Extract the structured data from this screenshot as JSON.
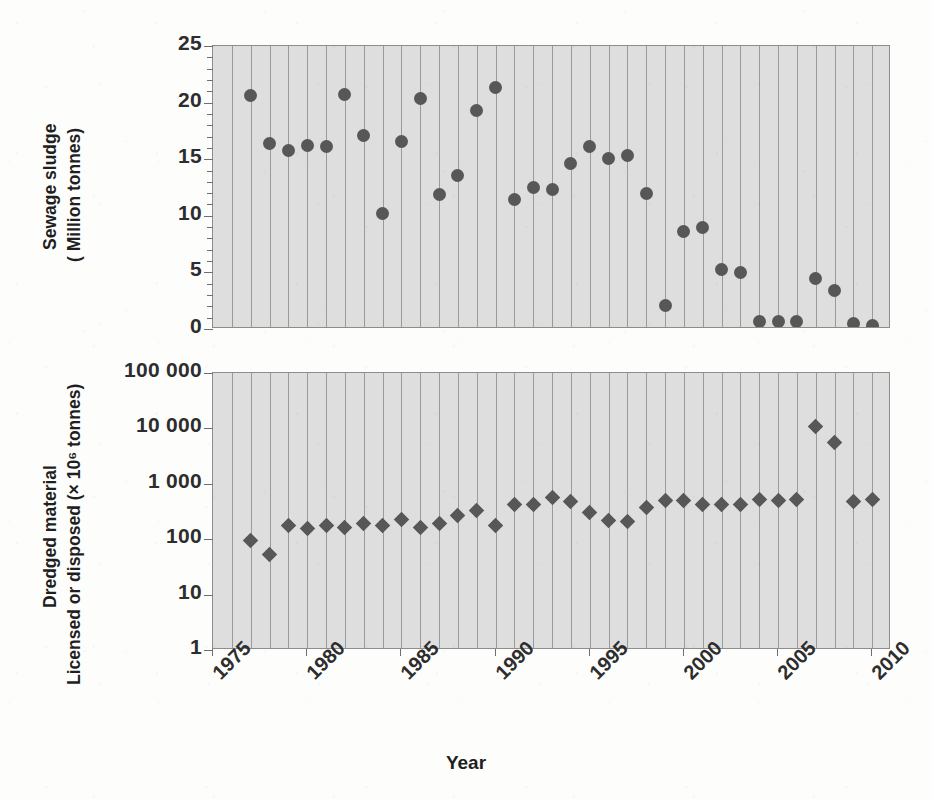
{
  "figure": {
    "x_axis_title": "Year",
    "background_color": "#dedede",
    "marker_color": "#575757",
    "gridline_color": "#9a9a9a",
    "axis_color": "#8d8d8d"
  },
  "panels": [
    {
      "id": "sewage-sludge",
      "y_title_line1": "Sewage sludge",
      "y_title_line2": "( Million tonnes)",
      "y_ticks": [
        "25",
        "20",
        "15",
        "10",
        "5",
        "0"
      ]
    },
    {
      "id": "dredged-material",
      "y_title_line1": "Dredged material",
      "y_title_line2": "Licensed or disposed (× 10⁶ tonnes)",
      "y_ticks": [
        "100 000",
        "10 000",
        "1 000",
        "100",
        "10",
        "1"
      ]
    }
  ],
  "x_ticks": [
    "1975",
    "1980",
    "1985",
    "1990",
    "1995",
    "2000",
    "2005",
    "2010"
  ],
  "chart_data": [
    {
      "type": "scatter",
      "title": "Sewage sludge",
      "xlabel": "Year",
      "ylabel": "Sewage sludge (Million tonnes)",
      "yscale": "linear",
      "ylim": [
        0,
        25
      ],
      "xlim": [
        1975,
        2011
      ],
      "ytick_values": [
        0,
        5,
        10,
        15,
        20,
        25
      ],
      "xtick_values": [
        1975,
        1980,
        1985,
        1990,
        1995,
        2000,
        2005,
        2010
      ],
      "grid": "vertical-only",
      "legend": "none",
      "marker": "circle",
      "x": [
        1977,
        1978,
        1979,
        1980,
        1981,
        1982,
        1983,
        1984,
        1985,
        1986,
        1987,
        1988,
        1989,
        1990,
        1991,
        1992,
        1993,
        1994,
        1995,
        1996,
        1997,
        1998,
        1999,
        2000,
        2001,
        2002,
        2003,
        2004,
        2005,
        2006,
        2007,
        2008,
        2009,
        2010
      ],
      "y": [
        20.6,
        16.4,
        15.8,
        16.2,
        16.1,
        20.7,
        17.1,
        10.2,
        16.6,
        20.4,
        11.9,
        13.6,
        19.3,
        21.3,
        11.4,
        12.5,
        12.3,
        14.6,
        16.1,
        15.1,
        15.3,
        12.0,
        2.1,
        8.6,
        9.0,
        5.3,
        5.0,
        0.7,
        0.7,
        0.7,
        4.5,
        3.4,
        0.5,
        0.3
      ]
    },
    {
      "type": "scatter",
      "title": "Dredged material",
      "xlabel": "Year",
      "ylabel": "Dredged material Licensed or disposed (× 10⁶ tonnes)",
      "yscale": "log",
      "ylim": [
        1,
        100000
      ],
      "xlim": [
        1975,
        2011
      ],
      "ytick_values": [
        1,
        10,
        100,
        1000,
        10000,
        100000
      ],
      "xtick_values": [
        1975,
        1980,
        1985,
        1990,
        1995,
        2000,
        2005,
        2010
      ],
      "grid": "vertical-only",
      "legend": "none",
      "marker": "diamond",
      "x": [
        1977,
        1978,
        1979,
        1980,
        1981,
        1982,
        1983,
        1984,
        1985,
        1986,
        1987,
        1988,
        1989,
        1990,
        1991,
        1992,
        1993,
        1994,
        1995,
        1996,
        1997,
        1998,
        1999,
        2000,
        2001,
        2002,
        2003,
        2004,
        2005,
        2006,
        2007,
        2008,
        2009,
        2010
      ],
      "y": [
        95,
        53,
        175,
        155,
        180,
        160,
        190,
        175,
        230,
        165,
        195,
        270,
        330,
        180,
        420,
        430,
        560,
        480,
        300,
        220,
        210,
        370,
        500,
        510,
        430,
        430,
        420,
        520,
        490,
        520,
        11000,
        5600,
        480,
        520
      ]
    }
  ]
}
